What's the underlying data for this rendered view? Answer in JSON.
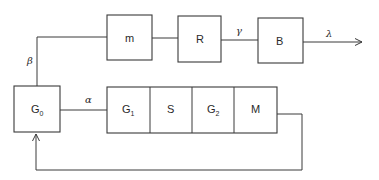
{
  "diagram": {
    "type": "block-diagram",
    "blocks": {
      "g0": {
        "label": "G",
        "sub": "0"
      },
      "m": {
        "label": "m"
      },
      "r": {
        "label": "R"
      },
      "b": {
        "label": "B"
      },
      "g1": {
        "label": "G",
        "sub": "1"
      },
      "s": {
        "label": "S"
      },
      "g2": {
        "label": "G",
        "sub": "2"
      },
      "mm": {
        "label": "M"
      }
    },
    "edges": {
      "beta": "β",
      "alpha": "α",
      "gamma": "γ",
      "lambda": "λ"
    },
    "colors": {
      "line": "#3a3a3a",
      "background": "#ffffff"
    }
  }
}
